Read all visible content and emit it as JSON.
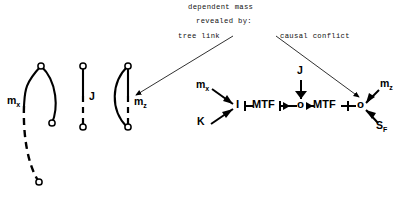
{
  "figure": {
    "title_lines": [
      {
        "text": "dependent mass",
        "x": 188,
        "y": 6
      },
      {
        "text": "revealed by:",
        "x": 196,
        "y": 20
      }
    ],
    "annotations": [
      {
        "name": "tree-link",
        "text": "tree link",
        "x": 178,
        "y": 34
      },
      {
        "name": "causal-conflict",
        "text": "causal conflict",
        "x": 278,
        "y": 34
      }
    ],
    "pointer_lines": [
      {
        "name": "tree-link-pointer",
        "x1": 232,
        "y1": 37,
        "x2": 133,
        "y2": 97,
        "arrow": true
      },
      {
        "name": "causal-conflict-pointer",
        "x1": 275,
        "y1": 37,
        "x2": 362,
        "y2": 97,
        "arrow": true
      }
    ]
  },
  "elements": {
    "loops": [
      {
        "name": "mass-x-loop",
        "label": "m",
        "subscript": "x",
        "label_x": 8,
        "label_y": 100,
        "nodes": [
          {
            "cx": 41,
            "cy": 66
          },
          {
            "cx": 52,
            "cy": 123
          },
          {
            "cx": 39,
            "cy": 182
          }
        ],
        "solid_arc": "M41,66 C24,84 25,92 24,106",
        "solid_arc2": "M41,66 C57,84 57,108 52,123",
        "dashed_arc": "M24,106 C23,132 27,163 39,182"
      },
      {
        "name": "inertia-j-loop",
        "label": "J",
        "subscript": "",
        "label_x": 88,
        "label_y": 97,
        "nodes": [
          {
            "cx": 83,
            "cy": 66
          },
          {
            "cx": 83,
            "cy": 127
          }
        ],
        "solid_arc": "M83,66 L83,97",
        "solid_arc2": "",
        "dashed_arc": "M83,97 L83,127"
      },
      {
        "name": "mass-z-loop",
        "label": "m",
        "subscript": "z",
        "label_x": 135,
        "label_y": 101,
        "nodes": [
          {
            "cx": 128,
            "cy": 66
          },
          {
            "cx": 128,
            "cy": 127
          }
        ],
        "solid_arc": "M128,66 L128,97",
        "solid_arc2": "M128,66 C112,82 110,108 128,127",
        "dashed_arc": "M128,97 L128,127"
      }
    ]
  },
  "bond_graph": {
    "junctions": [
      {
        "name": "junction-one-left",
        "label": "I",
        "x": 239,
        "y": 106
      },
      {
        "name": "junction-zero-mid",
        "label": "o",
        "x": 301,
        "y": 106
      },
      {
        "name": "junction-zero-right",
        "label": "o",
        "x": 361,
        "y": 106
      }
    ],
    "transformers": [
      {
        "name": "mtf-left",
        "label": "MTF",
        "x": 254,
        "y": 101
      },
      {
        "name": "mtf-right",
        "label": "MTF",
        "x": 315,
        "y": 101
      }
    ],
    "ports": [
      {
        "name": "port-mass-x",
        "label": "m",
        "subscript": "x",
        "x": 199,
        "y": 85
      },
      {
        "name": "port-spring-k",
        "label": "K",
        "subscript": "",
        "x": 199,
        "y": 122
      },
      {
        "name": "port-inertia-j",
        "label": "J",
        "subscript": "",
        "x": 298,
        "y": 72
      },
      {
        "name": "port-mass-z",
        "label": "m",
        "subscript": "z",
        "x": 381,
        "y": 84
      },
      {
        "name": "port-source-flow",
        "label": "S",
        "subscript": "F",
        "x": 375,
        "y": 126
      }
    ],
    "bonds": [
      {
        "name": "bond-mx-to-I",
        "x1": 213,
        "y1": 90,
        "x2": 234,
        "y2": 104
      },
      {
        "name": "bond-K-to-I",
        "x1": 211,
        "y1": 124,
        "x2": 234,
        "y2": 110
      },
      {
        "name": "bond-J-to-0",
        "x1": 301,
        "y1": 80,
        "x2": 301,
        "y2": 100
      },
      {
        "name": "bond-mz-to-0",
        "x1": 378,
        "y1": 90,
        "x2": 366,
        "y2": 102
      },
      {
        "name": "bond-0-to-SF",
        "x1": 366,
        "y1": 111,
        "x2": 377,
        "y2": 124
      },
      {
        "name": "bond-I-to-MTF",
        "x1": 244,
        "y1": 106,
        "x2": 253,
        "y2": 106
      },
      {
        "name": "bond-MTF-to-0",
        "x1": 281,
        "y1": 106,
        "x2": 297,
        "y2": 106
      },
      {
        "name": "bond-0-to-MTF",
        "x1": 306,
        "y1": 106,
        "x2": 314,
        "y2": 106
      },
      {
        "name": "bond-MTF2-to-0",
        "x1": 342,
        "y1": 106,
        "x2": 357,
        "y2": 106
      }
    ]
  },
  "colors": {
    "ink": "#000000",
    "annotation_ink": "#111111",
    "background": "#ffffff"
  }
}
